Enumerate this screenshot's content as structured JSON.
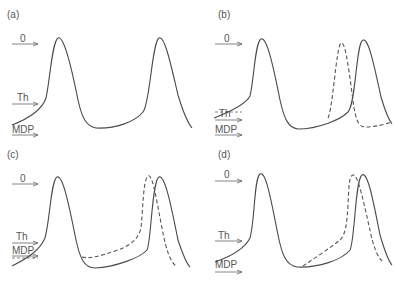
{
  "figure": {
    "colors": {
      "trace": "#4a4a4a",
      "label": "#555555",
      "background": "#ffffff"
    },
    "panels": [
      {
        "id": "a",
        "label": "(a)",
        "levels": {
          "zero": "0",
          "threshold": "Th",
          "mdp": "MDP"
        },
        "traces": [
          "solid"
        ]
      },
      {
        "id": "b",
        "label": "(b)",
        "levels": {
          "zero": "0",
          "threshold": "Th",
          "mdp": "MDP"
        },
        "traces": [
          "solid",
          "dashed"
        ],
        "note": "dashed threshold arrow lowered; dashed AP fires earlier"
      },
      {
        "id": "c",
        "label": "(c)",
        "levels": {
          "zero": "0",
          "threshold": "Th",
          "mdp": "MDP"
        },
        "traces": [
          "solid",
          "dashed"
        ],
        "note": "dashed MDP less negative; dashed AP fires earlier"
      },
      {
        "id": "d",
        "label": "(d)",
        "levels": {
          "zero": "0",
          "threshold": "Th",
          "mdp": "MDP"
        },
        "traces": [
          "solid",
          "dashed"
        ],
        "note": "dashed diastolic depolarization slope steeper; dashed AP fires earlier"
      }
    ]
  }
}
